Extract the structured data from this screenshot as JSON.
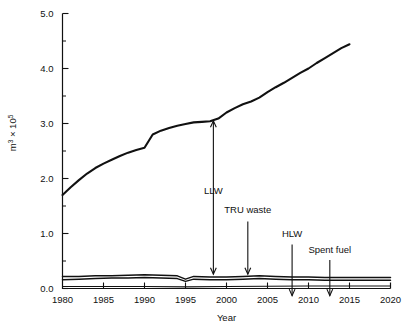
{
  "chart_data": {
    "type": "line",
    "title": "",
    "xlabel": "Year",
    "ylabel": "m3 x 10^5",
    "ylabel_parts": {
      "base": "m",
      "exp1": "3",
      "mult": " × 10",
      "exp2": "5"
    },
    "xlim": [
      1980,
      2020
    ],
    "ylim": [
      0.0,
      5.0
    ],
    "xticks": [
      1980,
      1985,
      1990,
      1995,
      2000,
      2005,
      2010,
      2015,
      2020
    ],
    "xtick_labels": [
      "1980",
      "1985",
      "1990",
      "1995",
      "2000",
      "2005",
      "2010",
      "2015",
      "2020"
    ],
    "yticks": [
      0.0,
      1.0,
      2.0,
      3.0,
      4.0,
      5.0
    ],
    "ytick_labels": [
      "0.0",
      "1.0",
      "2.0",
      "3.0",
      "4.0",
      "5.0"
    ],
    "yminorticks": [
      0.5,
      1.5,
      2.5,
      3.5,
      4.5
    ],
    "grid": false,
    "legend": "none",
    "series": [
      {
        "name": "Total (cumulative)",
        "x": [
          1980,
          1981,
          1982,
          1983,
          1984,
          1985,
          1986,
          1987,
          1988,
          1989,
          1990,
          1991,
          1992,
          1993,
          1994,
          1995,
          1996,
          1997,
          1998,
          1999,
          2000,
          2001,
          2002,
          2003,
          2004,
          2005,
          2006,
          2007,
          2008,
          2009,
          2010,
          2011,
          2012,
          2013,
          2014,
          2015
        ],
        "values": [
          1.7,
          1.84,
          1.97,
          2.09,
          2.19,
          2.27,
          2.34,
          2.41,
          2.47,
          2.52,
          2.56,
          2.8,
          2.87,
          2.92,
          2.96,
          2.99,
          3.02,
          3.03,
          3.04,
          3.09,
          3.2,
          3.28,
          3.35,
          3.4,
          3.47,
          3.57,
          3.66,
          3.74,
          3.83,
          3.92,
          4.0,
          4.1,
          4.19,
          4.28,
          4.37,
          4.44
        ]
      },
      {
        "name": "LLW-band upper",
        "x": [
          1980,
          1982,
          1984,
          1986,
          1988,
          1990,
          1992,
          1994,
          1995,
          1996,
          1998,
          2000,
          2002,
          2004,
          2006,
          2008,
          2010,
          2012,
          2014,
          2016,
          2018,
          2020
        ],
        "values": [
          0.22,
          0.22,
          0.23,
          0.23,
          0.24,
          0.25,
          0.24,
          0.23,
          0.17,
          0.22,
          0.21,
          0.21,
          0.22,
          0.23,
          0.22,
          0.21,
          0.21,
          0.2,
          0.2,
          0.2,
          0.2,
          0.2
        ]
      },
      {
        "name": "LLW-band lower",
        "x": [
          1980,
          1982,
          1984,
          1986,
          1988,
          1990,
          1992,
          1994,
          1995,
          1996,
          1998,
          2000,
          2002,
          2004,
          2006,
          2008,
          2010,
          2012,
          2014,
          2016,
          2018,
          2020
        ],
        "values": [
          0.16,
          0.17,
          0.18,
          0.19,
          0.19,
          0.2,
          0.19,
          0.18,
          0.13,
          0.17,
          0.16,
          0.16,
          0.17,
          0.18,
          0.17,
          0.16,
          0.16,
          0.15,
          0.15,
          0.15,
          0.15,
          0.15
        ]
      },
      {
        "name": "Baseline trace",
        "x": [
          1980,
          1985,
          1990,
          1995,
          2000,
          2005,
          2010,
          2015,
          2020
        ],
        "values": [
          0.035,
          0.035,
          0.035,
          0.03,
          0.035,
          0.04,
          0.045,
          0.045,
          0.045
        ]
      }
    ],
    "annotations": [
      {
        "label": "LLW",
        "x": 1998.4,
        "label_y": 1.72,
        "arrow_from": 0.26,
        "arrow_to": 3.05,
        "double": true
      },
      {
        "label": "TRU waste",
        "x": 2002.6,
        "label_y": 1.37,
        "arrow_from": 0.26,
        "arrow_to": 1.22,
        "double": false
      },
      {
        "label": "HLW",
        "x": 2008.0,
        "label_y": 0.93,
        "arrow_from": -0.13,
        "arrow_to": 0.8,
        "double": false
      },
      {
        "label": "Spent fuel",
        "x": 2012.6,
        "label_y": 0.64,
        "arrow_from": -0.13,
        "arrow_to": 0.52,
        "double": false
      }
    ]
  }
}
